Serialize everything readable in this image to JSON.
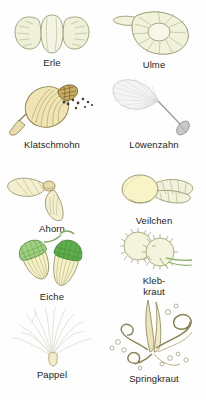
{
  "page": {
    "background_color": "#ffffff",
    "text_color": "#1d1d1d",
    "columns": 2,
    "rows": 5
  },
  "palette": {
    "outline": "#8a8a5e",
    "pale_green": "#eef0d8",
    "pale_yellow": "#f6f1c4",
    "seed_yellow": "#ece1a8",
    "capsule_tan": "#e4d7a6",
    "capsule_dark": "#a8924e",
    "leaf_green": "#8ec57a",
    "deep_green": "#5aa44c",
    "white_fluff": "#f2f2f2",
    "grey_outline": "#b7b7b7",
    "stem_green": "#b9c98e",
    "seed_black": "#4a4a3a"
  },
  "items": [
    {
      "id": "erle",
      "label": "Erle",
      "icon": "alder-cone-illustration",
      "column": 1,
      "row": 1,
      "dispersal": "Wasser"
    },
    {
      "id": "ulme",
      "label": "Ulme",
      "icon": "elm-samara-illustration",
      "column": 2,
      "row": 1,
      "dispersal": "Wind"
    },
    {
      "id": "klatschmohn",
      "label": "Klatschmohn",
      "icon": "poppy-capsule-illustration",
      "column": 1,
      "row": 2,
      "dispersal": "Streuer"
    },
    {
      "id": "loewenzahn",
      "label": "Löwenzahn",
      "icon": "dandelion-pappus-illustration",
      "column": 2,
      "row": 2,
      "dispersal": "Wind"
    },
    {
      "id": "ahorn",
      "label": "Ahorn",
      "icon": "maple-samara-illustration",
      "column": 1,
      "row": 3,
      "dispersal": "Wind"
    },
    {
      "id": "veilchen",
      "label": "Veilchen",
      "icon": "violet-seed-illustration",
      "column": 2,
      "row": 3,
      "dispersal": "Ameisen"
    },
    {
      "id": "eiche",
      "label": "Eiche",
      "icon": "acorn-illustration",
      "column": 1,
      "row": 4,
      "dispersal": "Tiere"
    },
    {
      "id": "klebkraut",
      "label": "Kleb-\nkraut",
      "icon": "cleavers-burr-illustration",
      "column": 2,
      "row": 4,
      "dispersal": "Klette"
    },
    {
      "id": "pappel",
      "label": "Pappel",
      "icon": "poplar-seed-hair-illustration",
      "column": 1,
      "row": 5,
      "dispersal": "Wind"
    },
    {
      "id": "springkraut",
      "label": "Springkraut",
      "icon": "balsam-coiled-valve-illustration",
      "column": 2,
      "row": 5,
      "dispersal": "Schleuder"
    }
  ]
}
